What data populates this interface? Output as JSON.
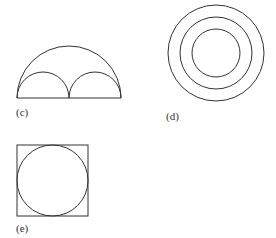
{
  "figures": [
    {
      "id": "c",
      "label": "(c)",
      "description": "semicircle containing two smaller semicircles on its diameter"
    },
    {
      "id": "d",
      "label": "(d)",
      "description": "three concentric circles"
    },
    {
      "id": "e",
      "label": "(e)",
      "description": "circle inscribed in a square"
    }
  ],
  "colors": {
    "stroke": "#333333",
    "background": "#ffffff"
  }
}
